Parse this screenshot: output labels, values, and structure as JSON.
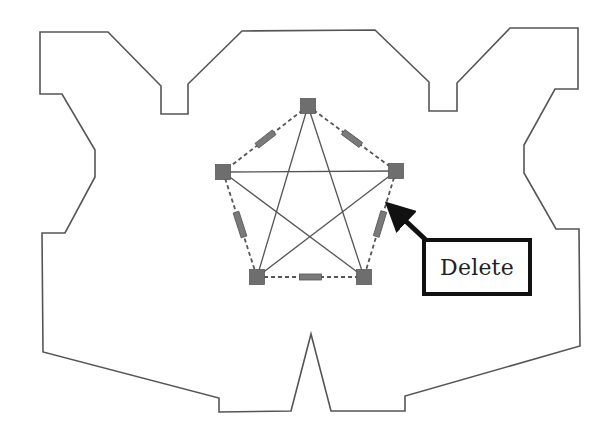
{
  "diagram": {
    "outline": {
      "stroke": "#555555",
      "stroke_width": 1.6,
      "points": [
        [
          40,
          32
        ],
        [
          108,
          32
        ],
        [
          161,
          86
        ],
        [
          161,
          114
        ],
        [
          188,
          114
        ],
        [
          188,
          84
        ],
        [
          242,
          31
        ],
        [
          375,
          30
        ],
        [
          429,
          82
        ],
        [
          429,
          111
        ],
        [
          457,
          111
        ],
        [
          457,
          83
        ],
        [
          510,
          28
        ],
        [
          578,
          28
        ],
        [
          578,
          89
        ],
        [
          555,
          89
        ],
        [
          524,
          145
        ],
        [
          524,
          173
        ],
        [
          556,
          229
        ],
        [
          579,
          229
        ],
        [
          580,
          346
        ],
        [
          405,
          396
        ],
        [
          405,
          411
        ],
        [
          331,
          411
        ],
        [
          311,
          334
        ],
        [
          291,
          411
        ],
        [
          219,
          412
        ],
        [
          219,
          398
        ],
        [
          43,
          352
        ],
        [
          42,
          233
        ],
        [
          65,
          233
        ],
        [
          95,
          177
        ],
        [
          95,
          150
        ],
        [
          62,
          94
        ],
        [
          40,
          94
        ]
      ]
    },
    "nodes": [
      {
        "id": "top",
        "x": 308,
        "y": 106
      },
      {
        "id": "left",
        "x": 223,
        "y": 172
      },
      {
        "id": "right",
        "x": 396,
        "y": 171
      },
      {
        "id": "bottom-left",
        "x": 257,
        "y": 277
      },
      {
        "id": "bottom-right",
        "x": 364,
        "y": 277
      }
    ],
    "node_size": 15,
    "node_color": "#6e6e6e",
    "solid_edges": [
      [
        "top",
        "bottom-left"
      ],
      [
        "top",
        "bottom-right"
      ],
      [
        "left",
        "right"
      ],
      [
        "left",
        "bottom-right"
      ],
      [
        "right",
        "bottom-left"
      ]
    ],
    "dashed_edges": [
      [
        "top",
        "left"
      ],
      [
        "top",
        "right"
      ],
      [
        "left",
        "bottom-left"
      ],
      [
        "right",
        "bottom-right"
      ],
      [
        "bottom-left",
        "bottom-right"
      ]
    ],
    "edge_color": "#555555",
    "edge_bars": [
      {
        "edge": [
          "top",
          "left"
        ],
        "length": 22,
        "thickness": 6
      },
      {
        "edge": [
          "top",
          "right"
        ],
        "length": 22,
        "thickness": 6
      },
      {
        "edge": [
          "left",
          "bottom-left"
        ],
        "length": 26,
        "thickness": 6
      },
      {
        "edge": [
          "right",
          "bottom-right"
        ],
        "length": 26,
        "thickness": 6
      },
      {
        "edge": [
          "bottom-left",
          "bottom-right"
        ],
        "length": 22,
        "thickness": 6
      }
    ],
    "bar_color": "#7a7a7a"
  },
  "callout": {
    "label": "Delete",
    "box": {
      "x": 422,
      "y": 238,
      "width": 110,
      "height": 58
    },
    "arrow": {
      "from": [
        428,
        242
      ],
      "to": [
        389,
        205
      ],
      "color": "#111111"
    }
  }
}
